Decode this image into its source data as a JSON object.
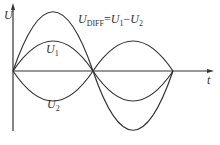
{
  "diagram": {
    "axes": {
      "y_label": "U",
      "x_label": "t"
    },
    "curves": [
      {
        "name": "U1",
        "label_main": "U",
        "label_sub": "1",
        "amplitude": 30,
        "phase": "positive first half"
      },
      {
        "name": "U2",
        "label_main": "U",
        "label_sub": "2",
        "amplitude": 30,
        "phase": "negative first half"
      },
      {
        "name": "UDIFF",
        "label_main": "U",
        "label_sub": "DIFF",
        "amplitude": 60
      }
    ],
    "equation": {
      "lhs_main": "U",
      "lhs_sub": "DIFF",
      "eq": "=",
      "a_main": "U",
      "a_sub": "1",
      "minus": "−",
      "b_main": "U",
      "b_sub": "2"
    },
    "caption": "",
    "colors": {
      "line": "#333333",
      "axis": "#333333"
    }
  }
}
